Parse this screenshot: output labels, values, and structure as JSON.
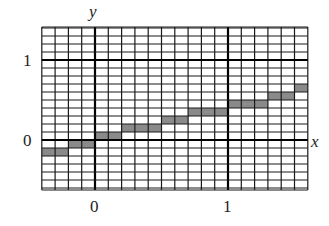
{
  "chart_data": {
    "type": "step",
    "title": "",
    "xlabel": "x",
    "ylabel": "y",
    "xlim": [
      -0.4,
      1.6
    ],
    "ylim": [
      -0.5,
      1.4
    ],
    "x_ticks": [
      {
        "value": 0,
        "label": "0"
      },
      {
        "value": 1,
        "label": "1"
      }
    ],
    "y_ticks": [
      {
        "value": 0,
        "label": "0"
      },
      {
        "value": 1,
        "label": "1"
      }
    ],
    "grid": true,
    "grid_step_x": 0.1,
    "grid_step_y": 0.1,
    "shaded_cells": [
      {
        "x0": -0.4,
        "x1": -0.2,
        "y0": -0.2,
        "y1": -0.1
      },
      {
        "x0": -0.2,
        "x1": 0.0,
        "y0": -0.1,
        "y1": 0.0
      },
      {
        "x0": 0.0,
        "x1": 0.2,
        "y0": 0.0,
        "y1": 0.1
      },
      {
        "x0": 0.2,
        "x1": 0.5,
        "y0": 0.1,
        "y1": 0.2
      },
      {
        "x0": 0.5,
        "x1": 0.7,
        "y0": 0.2,
        "y1": 0.3
      },
      {
        "x0": 0.7,
        "x1": 1.0,
        "y0": 0.3,
        "y1": 0.4
      },
      {
        "x0": 1.0,
        "x1": 1.3,
        "y0": 0.4,
        "y1": 0.5
      },
      {
        "x0": 1.3,
        "x1": 1.5,
        "y0": 0.5,
        "y1": 0.6
      },
      {
        "x0": 1.5,
        "x1": 1.6,
        "y0": 0.6,
        "y1": 0.7
      }
    ],
    "colors": {
      "grid": "#1a1a1a",
      "axis": "#000000",
      "shade": "#8a8a8a",
      "background": "#ffffff"
    }
  },
  "labels": {
    "y_axis": "y",
    "x_axis": "x",
    "y_tick_1": "1",
    "y_tick_0": "0",
    "x_tick_0": "0",
    "x_tick_1": "1"
  }
}
